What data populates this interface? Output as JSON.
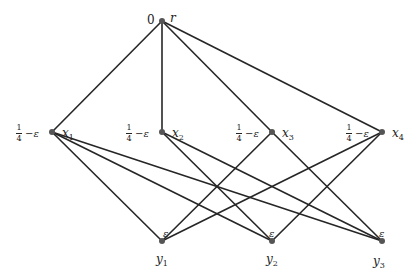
{
  "diagram": {
    "type": "graph",
    "nodes": [
      {
        "id": "r",
        "label": "r",
        "value": "0",
        "x": 162,
        "y": 21
      },
      {
        "id": "x1",
        "label": "x1",
        "value": "1/4 − ε",
        "x": 52,
        "y": 132
      },
      {
        "id": "x2",
        "label": "x2",
        "value": "1/4 − ε",
        "x": 162,
        "y": 132
      },
      {
        "id": "x3",
        "label": "x3",
        "value": "1/4 − ε",
        "x": 272,
        "y": 132
      },
      {
        "id": "x4",
        "label": "x4",
        "value": "1/4 − ε",
        "x": 382,
        "y": 132
      },
      {
        "id": "y1",
        "label": "y1",
        "value": "ε",
        "x": 162,
        "y": 241
      },
      {
        "id": "y2",
        "label": "y2",
        "value": "ε",
        "x": 272,
        "y": 241
      },
      {
        "id": "y3",
        "label": "y3",
        "value": "ε",
        "x": 382,
        "y": 241
      }
    ],
    "edges": [
      [
        "r",
        "x1"
      ],
      [
        "r",
        "x2"
      ],
      [
        "r",
        "x3"
      ],
      [
        "r",
        "x4"
      ],
      [
        "x1",
        "y1"
      ],
      [
        "x1",
        "y2"
      ],
      [
        "x1",
        "y3"
      ],
      [
        "x2",
        "y2"
      ],
      [
        "x2",
        "y3"
      ],
      [
        "x3",
        "y1"
      ],
      [
        "x3",
        "y3"
      ],
      [
        "x4",
        "y1"
      ],
      [
        "x4",
        "y2"
      ]
    ]
  },
  "labels": {
    "r": {
      "name": "r",
      "value": "0"
    },
    "x1": {
      "base": "x",
      "sub": "1",
      "frac_num": "1",
      "frac_den": "4",
      "minus": " − ",
      "eps": "ε"
    },
    "x2": {
      "base": "x",
      "sub": "2",
      "frac_num": "1",
      "frac_den": "4",
      "minus": " − ",
      "eps": "ε"
    },
    "x3": {
      "base": "x",
      "sub": "3",
      "frac_num": "1",
      "frac_den": "4",
      "minus": " − ",
      "eps": "ε"
    },
    "x4": {
      "base": "x",
      "sub": "4",
      "frac_num": "1",
      "frac_den": "4",
      "minus": " − ",
      "eps": "ε"
    },
    "y1": {
      "base": "y",
      "sub": "1",
      "eps": "ε"
    },
    "y2": {
      "base": "y",
      "sub": "2",
      "eps": "ε"
    },
    "y3": {
      "base": "y",
      "sub": "3",
      "eps": "ε"
    }
  }
}
